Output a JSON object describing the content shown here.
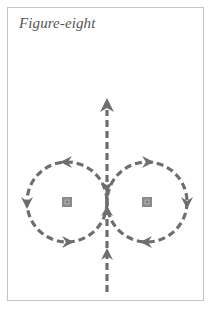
{
  "title": "Figure-eight",
  "colors": {
    "stroke": "#6e6e6e",
    "frame": "#c4c4c4",
    "title": "#555555",
    "marker_fill": "#8a8a8a",
    "marker_inner": "#b0b0b0"
  },
  "diagram": {
    "type": "figure-eight movement pattern",
    "loops": [
      {
        "name": "left-loop",
        "center": [
          67,
          202
        ],
        "radius": 40,
        "direction": "counter-clockwise"
      },
      {
        "name": "right-loop",
        "center": [
          147,
          202
        ],
        "radius": 40,
        "direction": "clockwise"
      }
    ],
    "markers": [
      {
        "name": "left-cone-marker",
        "position": [
          67,
          202
        ]
      },
      {
        "name": "right-cone-marker",
        "position": [
          147,
          202
        ]
      }
    ],
    "center_line": {
      "x": 107,
      "y_start": 290,
      "y_end": 100,
      "direction": "up"
    },
    "arrow_icons": [
      "arrow-up-icon",
      "arrow-left-icon",
      "arrow-down-icon",
      "arrow-right-icon"
    ]
  }
}
